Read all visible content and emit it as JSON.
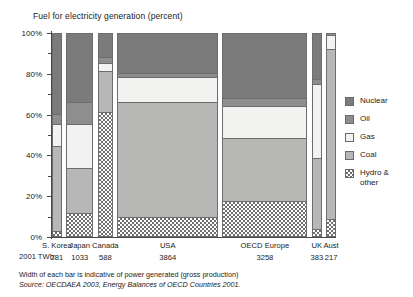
{
  "chart_data": {
    "type": "bar",
    "title": "Fuel for electricity generation (percent)",
    "xlabel": "",
    "ylabel": "",
    "ylim": [
      0,
      100
    ],
    "ytick_labels": [
      "0%",
      "20%",
      "40%",
      "60%",
      "80%",
      "100%"
    ],
    "ytick_values": [
      0,
      20,
      40,
      60,
      80,
      100
    ],
    "grid": false,
    "stacked": true,
    "legend_position": "right",
    "categories": [
      "S. Korea",
      "Japan",
      "Canada",
      "USA",
      "OECD Europe",
      "UK",
      "Aust"
    ],
    "bar_widths_twh": [
      281,
      1033,
      588,
      3864,
      3258,
      383,
      217
    ],
    "series": [
      {
        "name": "Nuclear",
        "color": "#7b7b7b",
        "values": [
          40,
          34,
          12,
          20,
          32,
          23,
          0
        ]
      },
      {
        "name": "Oil",
        "color": "#8e8e8e",
        "values": [
          5,
          11,
          3,
          2,
          4,
          2,
          1
        ]
      },
      {
        "name": "Gas",
        "color": "#f2f2f0",
        "values": [
          11,
          22,
          4,
          12,
          16,
          37,
          7
        ]
      },
      {
        "name": "Coal",
        "color": "#b7b7b5",
        "values": [
          42,
          22,
          20,
          57,
          31,
          35,
          84
        ]
      },
      {
        "name": "Hydro & other",
        "color": "hatch",
        "values": [
          2,
          11,
          61,
          9,
          17,
          3,
          8
        ]
      }
    ],
    "annotations": [
      "Width of each bar is indicative of power generated (gross production)",
      "Source: OECDAEA 2003, Energy Balances of OECD Countries 2001."
    ]
  },
  "axis": {
    "row_label": "2001 TWh:",
    "tick_labels": [
      "100%",
      "80%",
      "60%",
      "40%",
      "20%",
      "0%"
    ]
  },
  "legend": {
    "items": [
      {
        "label": "Nuclear",
        "swatch": "nuclear-swatch"
      },
      {
        "label": "Oil",
        "swatch": "oil-swatch"
      },
      {
        "label": "Gas",
        "swatch": "gas-swatch"
      },
      {
        "label": "Coal",
        "swatch": "coal-swatch"
      },
      {
        "label": "Hydro &\nother",
        "swatch": "hydro-swatch"
      }
    ]
  },
  "footnotes": {
    "line1": "Width of each bar is indicative of power generated (gross production)",
    "line2": "Source: OECDAEA 2003, Energy Balances of OECD Countries 2001."
  },
  "bars": [
    {
      "name": "S. Korea",
      "twh": "281"
    },
    {
      "name": "Japan",
      "twh": "1033"
    },
    {
      "name": "Canada",
      "twh": "588"
    },
    {
      "name": "USA",
      "twh": "3864"
    },
    {
      "name": "OECD Europe",
      "twh": "3258"
    },
    {
      "name": "UK",
      "twh": "383"
    },
    {
      "name": "Aust",
      "twh": "217"
    }
  ]
}
